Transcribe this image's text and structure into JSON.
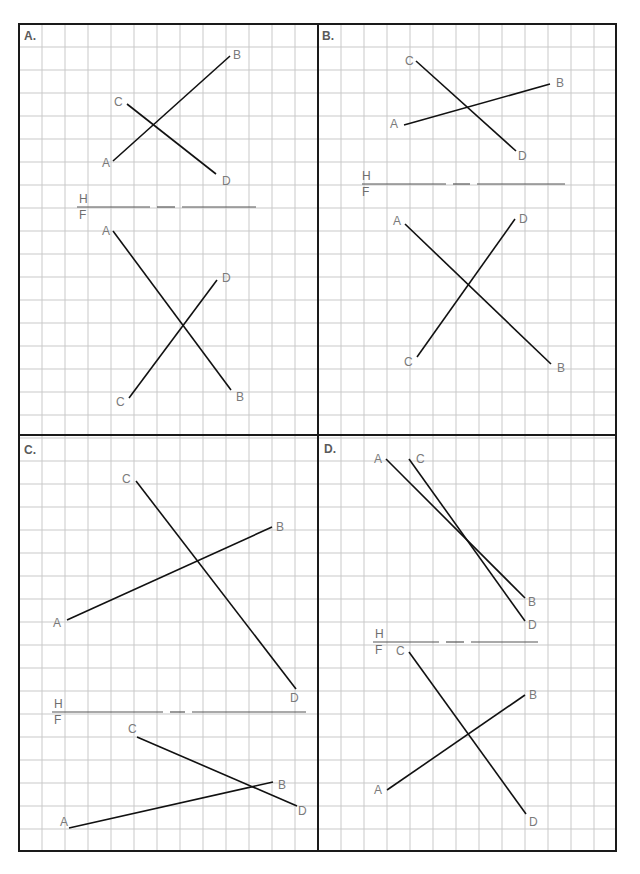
{
  "figure": {
    "panels": [
      {
        "id": "A",
        "title": "A.",
        "fold_line": {
          "upper_label": "H",
          "lower_label": "F"
        },
        "views": [
          {
            "name": "horizontal",
            "segments": [
              {
                "name": "AB",
                "start_label": "A",
                "end_label": "B"
              },
              {
                "name": "CD",
                "start_label": "C",
                "end_label": "D"
              }
            ]
          },
          {
            "name": "frontal",
            "segments": [
              {
                "name": "AB",
                "start_label": "A",
                "end_label": "B"
              },
              {
                "name": "CD",
                "start_label": "C",
                "end_label": "D"
              }
            ]
          }
        ]
      },
      {
        "id": "B",
        "title": "B.",
        "fold_line": {
          "upper_label": "H",
          "lower_label": "F"
        },
        "views": [
          {
            "name": "horizontal",
            "segments": [
              {
                "name": "AB",
                "start_label": "A",
                "end_label": "B"
              },
              {
                "name": "CD",
                "start_label": "C",
                "end_label": "D"
              }
            ]
          },
          {
            "name": "frontal",
            "segments": [
              {
                "name": "AB",
                "start_label": "A",
                "end_label": "B"
              },
              {
                "name": "CD",
                "start_label": "C",
                "end_label": "D"
              }
            ]
          }
        ]
      },
      {
        "id": "C",
        "title": "C.",
        "fold_line": {
          "upper_label": "H",
          "lower_label": "F"
        },
        "views": [
          {
            "name": "horizontal",
            "segments": [
              {
                "name": "AB",
                "start_label": "A",
                "end_label": "B"
              },
              {
                "name": "CD",
                "start_label": "C",
                "end_label": "D"
              }
            ]
          },
          {
            "name": "frontal",
            "segments": [
              {
                "name": "AB",
                "start_label": "A",
                "end_label": "B"
              },
              {
                "name": "CD",
                "start_label": "C",
                "end_label": "D"
              }
            ]
          }
        ]
      },
      {
        "id": "D",
        "title": "D.",
        "fold_line": {
          "upper_label": "H",
          "lower_label": "F"
        },
        "views": [
          {
            "name": "horizontal",
            "segments": [
              {
                "name": "AB",
                "start_label": "A",
                "end_label": "B"
              },
              {
                "name": "CD",
                "start_label": "C",
                "end_label": "D"
              }
            ]
          },
          {
            "name": "frontal",
            "segments": [
              {
                "name": "AB",
                "start_label": "A",
                "end_label": "B"
              },
              {
                "name": "CD",
                "start_label": "C",
                "end_label": "D"
              }
            ]
          }
        ]
      }
    ]
  }
}
